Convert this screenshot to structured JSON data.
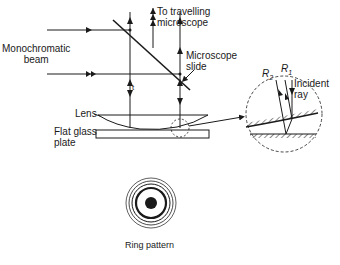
{
  "labels": {
    "beam_line1": "Monochromatic",
    "beam_line2": "beam",
    "to_line1": "To travelling",
    "to_line2": "microscope",
    "slide_line1": "Microscope",
    "slide_line2": "slide",
    "lens": "Lens",
    "plate_line1": "Flat glass",
    "plate_line2": "plate",
    "r2": "R",
    "r2_sub": "2",
    "r1": "R",
    "r1_sub": "1",
    "incident_line1": "Incident",
    "incident_line2": "ray",
    "t_label": "t",
    "ring_caption": "Ring pattern"
  },
  "colors": {
    "ink": "#1a1a1a",
    "background": "#ffffff"
  }
}
